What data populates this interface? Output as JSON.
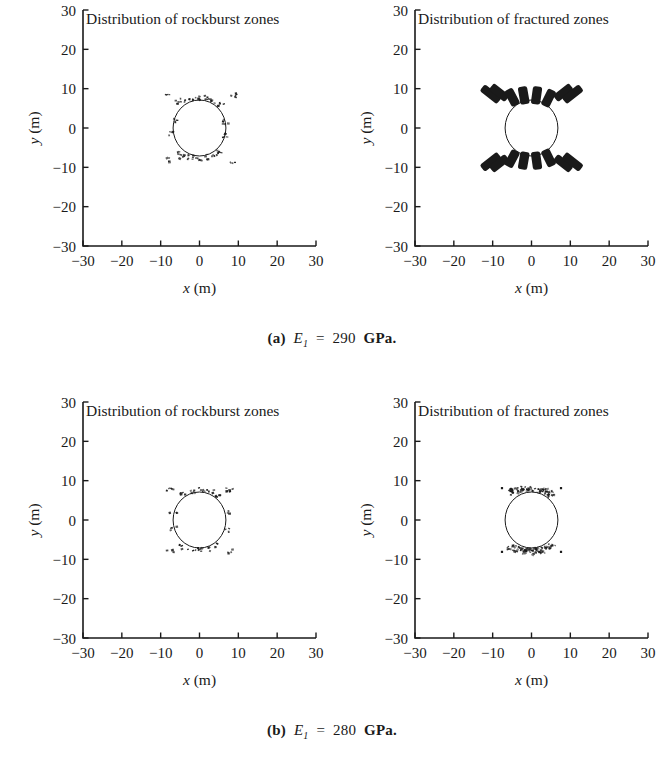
{
  "figure": {
    "background": "#ffffff",
    "ink": "#1a1a1a",
    "panel_count": 4
  },
  "axes": {
    "x_label_var": "x",
    "x_label_unit": "(m)",
    "y_label_var": "y",
    "y_label_unit": "(m)",
    "x_ticks": [
      "−30",
      "−20",
      "−10",
      "0",
      "10",
      "20",
      "30"
    ],
    "y_ticks": [
      "30",
      "20",
      "10",
      "0",
      "−10",
      "−20",
      "−30"
    ],
    "x_tick_values": [
      -30,
      -20,
      -10,
      0,
      10,
      20,
      30
    ],
    "y_tick_values": [
      30,
      20,
      10,
      0,
      -10,
      -20,
      -30
    ],
    "xlim": [
      -30,
      30
    ],
    "ylim": [
      -30,
      30
    ]
  },
  "captions": {
    "a": {
      "label": "(a)",
      "variable": "E",
      "subscript": "1",
      "equals": "=",
      "value": "290",
      "unit": "GPa."
    },
    "b": {
      "label": "(b)",
      "variable": "E",
      "subscript": "1",
      "equals": "=",
      "value": "280",
      "unit": "GPa."
    }
  },
  "chart_data": [
    {
      "type": "scatter",
      "panel": "a-left",
      "title": "Distribution of rockburst zones",
      "xlabel": "x (m)",
      "ylabel": "y (m)",
      "xlim": [
        -30,
        30
      ],
      "ylim": [
        -30,
        30
      ],
      "grid": false,
      "legend": "none",
      "tunnel_circle": {
        "cx": 0,
        "cy": 0,
        "r": 6.8
      },
      "marker_kind": "small-speckle",
      "points": [
        {
          "x": -5.6,
          "y": 6.6
        },
        {
          "x": -4.3,
          "y": 7.1
        },
        {
          "x": -2.8,
          "y": 7.5
        },
        {
          "x": -1.2,
          "y": 7.6
        },
        {
          "x": 0.6,
          "y": 7.6
        },
        {
          "x": 2.2,
          "y": 7.4
        },
        {
          "x": 3.8,
          "y": 6.9
        },
        {
          "x": 5.2,
          "y": 6.2
        },
        {
          "x": -5.6,
          "y": -6.6
        },
        {
          "x": -4.3,
          "y": -7.1
        },
        {
          "x": -2.8,
          "y": -7.5
        },
        {
          "x": -1.2,
          "y": -7.6
        },
        {
          "x": 0.6,
          "y": -7.6
        },
        {
          "x": 2.2,
          "y": -7.4
        },
        {
          "x": 3.8,
          "y": -6.9
        },
        {
          "x": 5.2,
          "y": -6.2
        },
        {
          "x": -6.9,
          "y": 1.8
        },
        {
          "x": -6.9,
          "y": -1.5
        },
        {
          "x": 6.9,
          "y": 1.5
        },
        {
          "x": 6.9,
          "y": -1.8
        },
        {
          "x": -8.6,
          "y": 8.2
        },
        {
          "x": 8.4,
          "y": 8.4
        },
        {
          "x": -8.6,
          "y": -8.2
        },
        {
          "x": 8.4,
          "y": -8.4
        }
      ]
    },
    {
      "type": "scatter",
      "panel": "a-right",
      "title": "Distribution of fractured zones",
      "xlabel": "x (m)",
      "ylabel": "y (m)",
      "xlim": [
        -30,
        30
      ],
      "ylim": [
        -30,
        30
      ],
      "grid": false,
      "legend": "none",
      "tunnel_circle": {
        "cx": 0,
        "cy": 0,
        "r": 6.8
      },
      "marker_kind": "thick-radial-dash",
      "dashes": [
        {
          "x": -10.5,
          "y": 8.6,
          "angle": -52,
          "len": 5.6,
          "w": 2.2
        },
        {
          "x": -8.3,
          "y": 9.0,
          "angle": -52,
          "len": 5.2,
          "w": 2.2
        },
        {
          "x": -5.0,
          "y": 7.8,
          "angle": -28,
          "len": 4.6,
          "w": 2.4
        },
        {
          "x": -2.0,
          "y": 8.3,
          "angle": -10,
          "len": 4.6,
          "w": 2.4
        },
        {
          "x": 1.3,
          "y": 8.3,
          "angle": 8,
          "len": 4.6,
          "w": 2.4
        },
        {
          "x": 4.4,
          "y": 7.6,
          "angle": 26,
          "len": 4.6,
          "w": 2.4
        },
        {
          "x": 8.2,
          "y": 9.0,
          "angle": 52,
          "len": 5.2,
          "w": 2.2
        },
        {
          "x": 10.6,
          "y": 8.6,
          "angle": 52,
          "len": 5.6,
          "w": 2.2
        },
        {
          "x": -10.5,
          "y": -8.6,
          "angle": 52,
          "len": 5.6,
          "w": 2.2
        },
        {
          "x": -8.3,
          "y": -9.0,
          "angle": 52,
          "len": 5.2,
          "w": 2.2
        },
        {
          "x": -5.0,
          "y": -7.8,
          "angle": 28,
          "len": 4.6,
          "w": 2.4
        },
        {
          "x": -2.0,
          "y": -8.3,
          "angle": 10,
          "len": 4.6,
          "w": 2.4
        },
        {
          "x": 1.3,
          "y": -8.3,
          "angle": -8,
          "len": 4.6,
          "w": 2.4
        },
        {
          "x": 4.4,
          "y": -7.6,
          "angle": -26,
          "len": 4.6,
          "w": 2.4
        },
        {
          "x": 8.2,
          "y": -9.0,
          "angle": -52,
          "len": 5.2,
          "w": 2.2
        },
        {
          "x": 10.6,
          "y": -8.6,
          "angle": -52,
          "len": 5.6,
          "w": 2.2
        }
      ]
    },
    {
      "type": "scatter",
      "panel": "b-left",
      "title": "Distribution of rockburst zones",
      "xlabel": "x (m)",
      "ylabel": "y (m)",
      "xlim": [
        -30,
        30
      ],
      "ylim": [
        -30,
        30
      ],
      "grid": false,
      "legend": "none",
      "tunnel_circle": {
        "cx": 0,
        "cy": 0,
        "r": 6.8
      },
      "marker_kind": "small-speckle",
      "points": [
        {
          "x": -4.2,
          "y": 6.9
        },
        {
          "x": -2.0,
          "y": 7.4
        },
        {
          "x": 0.4,
          "y": 7.5
        },
        {
          "x": 2.6,
          "y": 7.2
        },
        {
          "x": 4.6,
          "y": 6.4
        },
        {
          "x": -4.2,
          "y": -6.9
        },
        {
          "x": -2.0,
          "y": -7.4
        },
        {
          "x": 0.4,
          "y": -7.5
        },
        {
          "x": 2.6,
          "y": -7.2
        },
        {
          "x": 4.6,
          "y": -6.4
        },
        {
          "x": -6.8,
          "y": 2.4
        },
        {
          "x": -6.9,
          "y": -2.2
        },
        {
          "x": 6.8,
          "y": 2.2
        },
        {
          "x": 6.9,
          "y": -2.4
        },
        {
          "x": -7.6,
          "y": 8.0
        },
        {
          "x": 7.5,
          "y": 8.0
        },
        {
          "x": -7.6,
          "y": -8.0
        },
        {
          "x": 7.5,
          "y": -8.0
        }
      ]
    },
    {
      "type": "scatter",
      "panel": "b-right",
      "title": "Distribution of fractured zones",
      "xlabel": "x (m)",
      "ylabel": "y (m)",
      "xlim": [
        -30,
        30
      ],
      "ylim": [
        -30,
        30
      ],
      "grid": false,
      "legend": "none",
      "tunnel_circle": {
        "cx": 0,
        "cy": 0,
        "r": 6.8
      },
      "marker_kind": "dense-speckle-cluster",
      "clusters": [
        {
          "x": -4.6,
          "y": 7.2,
          "rx": 1.7,
          "ry": 0.9,
          "n": 16
        },
        {
          "x": -2.3,
          "y": 7.8,
          "rx": 1.6,
          "ry": 0.8,
          "n": 16
        },
        {
          "x": 0.2,
          "y": 7.9,
          "rx": 1.7,
          "ry": 0.8,
          "n": 16
        },
        {
          "x": 2.6,
          "y": 7.5,
          "rx": 1.7,
          "ry": 0.9,
          "n": 16
        },
        {
          "x": 4.7,
          "y": 6.8,
          "rx": 1.5,
          "ry": 0.9,
          "n": 12
        },
        {
          "x": -4.6,
          "y": -7.2,
          "rx": 1.7,
          "ry": 0.9,
          "n": 16
        },
        {
          "x": -2.3,
          "y": -7.8,
          "rx": 1.6,
          "ry": 0.8,
          "n": 16
        },
        {
          "x": 0.2,
          "y": -7.9,
          "rx": 1.7,
          "ry": 0.8,
          "n": 16
        },
        {
          "x": 2.6,
          "y": -7.5,
          "rx": 1.7,
          "ry": 0.9,
          "n": 16
        },
        {
          "x": 4.7,
          "y": -6.8,
          "rx": 1.5,
          "ry": 0.9,
          "n": 12
        }
      ],
      "corner_points": [
        {
          "x": -7.6,
          "y": 8.1
        },
        {
          "x": 7.6,
          "y": 8.1
        },
        {
          "x": -7.6,
          "y": -8.1
        },
        {
          "x": 7.6,
          "y": -8.1
        }
      ]
    }
  ]
}
